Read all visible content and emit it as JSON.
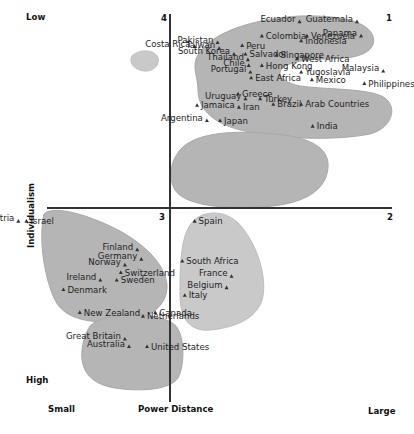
{
  "chart_data": {
    "type": "scatter",
    "title": "",
    "xlabel": "Power Distance",
    "ylabel": "Individualism",
    "x_ends": {
      "low": "Small",
      "high": "Large"
    },
    "y_ends": {
      "top": "Low",
      "bottom": "High"
    },
    "quadrants": {
      "top_left": "4",
      "top_right": "1",
      "bottom_left": "3",
      "bottom_right": "2"
    },
    "colors": {
      "cluster_fill": "#b5b5b5",
      "cluster_fill_light": "#c9c9c9",
      "axis": "#333333",
      "marker": "#333333"
    },
    "clusters": [
      {
        "name": "costa-rica",
        "tone": "light",
        "points": [
          {
            "label": "Costa Rica",
            "x": 0.3,
            "y": 0.85
          }
        ]
      },
      {
        "name": "top-right",
        "tone": "dark",
        "points": [
          {
            "label": "Ecuador",
            "x": 1.58,
            "y": 0.98
          },
          {
            "label": "Guatemala",
            "x": 2.28,
            "y": 0.98
          },
          {
            "label": "Colombia",
            "x": 1.12,
            "y": 0.905
          },
          {
            "label": "Venezuela",
            "x": 1.67,
            "y": 0.905
          },
          {
            "label": "Panama",
            "x": 2.33,
            "y": 0.905
          },
          {
            "label": "Indonesia",
            "x": 1.6,
            "y": 0.88
          },
          {
            "label": "Pakistan",
            "x": 0.58,
            "y": 0.87
          },
          {
            "label": "Taiwan",
            "x": 0.6,
            "y": 0.84
          },
          {
            "label": "Peru",
            "x": 0.88,
            "y": 0.855
          },
          {
            "label": "South Korea",
            "x": 0.78,
            "y": 0.81
          },
          {
            "label": "Salvador",
            "x": 0.92,
            "y": 0.81
          },
          {
            "label": "Singapore",
            "x": 1.3,
            "y": 0.805
          },
          {
            "label": "Thailand",
            "x": 0.95,
            "y": 0.78
          },
          {
            "label": "West Africa",
            "x": 1.55,
            "y": 0.785
          },
          {
            "label": "Chile",
            "x": 0.96,
            "y": 0.75
          },
          {
            "label": "Hong Kong",
            "x": 1.12,
            "y": 0.75
          },
          {
            "label": "Portugal",
            "x": 0.98,
            "y": 0.715
          },
          {
            "label": "Yugoslavia",
            "x": 1.6,
            "y": 0.715
          },
          {
            "label": "Malaysia",
            "x": 2.6,
            "y": 0.72
          },
          {
            "label": "East Africa",
            "x": 0.99,
            "y": 0.685
          },
          {
            "label": "Mexico",
            "x": 1.73,
            "y": 0.675
          },
          {
            "label": "Philippines",
            "x": 2.37,
            "y": 0.655
          }
        ]
      },
      {
        "name": "middle-right",
        "tone": "dark",
        "points": [
          {
            "label": "Greece",
            "x": 0.83,
            "y": 0.6
          },
          {
            "label": "Uruguay",
            "x": 0.92,
            "y": 0.575
          },
          {
            "label": "Turkey",
            "x": 1.1,
            "y": 0.575
          },
          {
            "label": "Jamaica",
            "x": 0.33,
            "y": 0.54
          },
          {
            "label": "Iran",
            "x": 0.84,
            "y": 0.53
          },
          {
            "label": "Brazil",
            "x": 1.26,
            "y": 0.545
          },
          {
            "label": "Arab Countries",
            "x": 1.6,
            "y": 0.545
          },
          {
            "label": "Argentina",
            "x": 0.45,
            "y": 0.46
          },
          {
            "label": "Japan",
            "x": 0.61,
            "y": 0.46
          },
          {
            "label": "India",
            "x": 1.74,
            "y": 0.43
          }
        ]
      },
      {
        "name": "bottom-left",
        "tone": "dark",
        "points": [
          {
            "label": "Austria",
            "x": -1.85,
            "y": -0.07
          },
          {
            "label": "Israel",
            "x": -1.75,
            "y": -0.07
          },
          {
            "label": "Finland",
            "x": -0.4,
            "y": -0.22
          },
          {
            "label": "Germany",
            "x": -0.35,
            "y": -0.27
          },
          {
            "label": "Norway",
            "x": -0.55,
            "y": -0.3
          },
          {
            "label": "Switzerland",
            "x": -0.6,
            "y": -0.34
          },
          {
            "label": "Ireland",
            "x": -0.85,
            "y": -0.38
          },
          {
            "label": "Sweden",
            "x": -0.65,
            "y": -0.38
          },
          {
            "label": "Denmark",
            "x": -1.3,
            "y": -0.43
          }
        ]
      },
      {
        "name": "bottom-right",
        "tone": "light",
        "points": [
          {
            "label": "Spain",
            "x": 0.3,
            "y": -0.07
          },
          {
            "label": "South Africa",
            "x": 0.15,
            "y": -0.28
          },
          {
            "label": "France",
            "x": 0.75,
            "y": -0.36
          },
          {
            "label": "Belgium",
            "x": 0.69,
            "y": -0.42
          },
          {
            "label": "Italy",
            "x": 0.18,
            "y": -0.46
          }
        ]
      },
      {
        "name": "bottom-anglo",
        "tone": "dark",
        "points": [
          {
            "label": "New Zealand",
            "x": -1.1,
            "y": -0.55
          },
          {
            "label": "Canada",
            "x": -0.18,
            "y": -0.55
          },
          {
            "label": "Netherlands",
            "x": -0.33,
            "y": -0.57
          },
          {
            "label": "Great Britain",
            "x": -0.55,
            "y": -0.69
          },
          {
            "label": "Australia",
            "x": -0.5,
            "y": -0.73
          },
          {
            "label": "United States",
            "x": -0.28,
            "y": -0.73
          }
        ]
      }
    ]
  }
}
